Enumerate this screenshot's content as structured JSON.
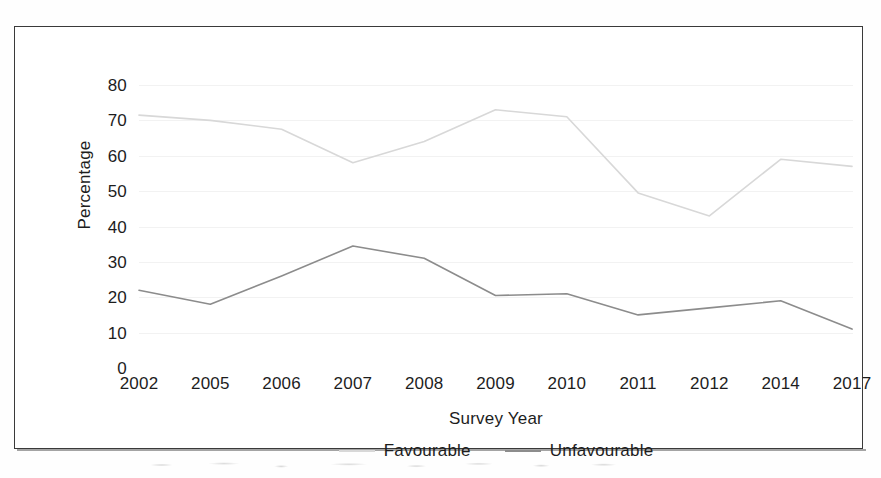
{
  "figure": {
    "border_color": "#3a3a3a",
    "background": "#ffffff"
  },
  "chart_data": {
    "type": "line",
    "title": "",
    "xlabel": "Survey Year",
    "ylabel": "Percentage",
    "categories": [
      "2002",
      "2005",
      "2006",
      "2007",
      "2008",
      "2009",
      "2010",
      "2011",
      "2012",
      "2014",
      "2017"
    ],
    "ylim": [
      0,
      80
    ],
    "ytick_labels": [
      "80",
      "70",
      "60",
      "50",
      "40",
      "30",
      "20",
      "10",
      "0"
    ],
    "ytick_values": [
      80,
      70,
      60,
      50,
      40,
      30,
      20,
      10,
      0
    ],
    "ytick_step": 10,
    "grid": "faint horizontal gridlines",
    "legend_position": "bottom-center",
    "series": [
      {
        "name": "Favourable",
        "color": "#d8d8d8",
        "values": [
          71.5,
          70,
          67.5,
          58,
          64,
          73,
          71,
          49.5,
          43,
          59,
          57
        ]
      },
      {
        "name": "Unfavourable",
        "color": "#8c8c8c",
        "values": [
          22,
          18,
          26,
          34.5,
          31,
          20.5,
          21,
          15,
          17,
          19,
          11
        ]
      }
    ]
  }
}
